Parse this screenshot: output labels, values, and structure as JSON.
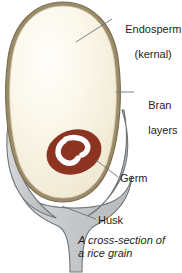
{
  "figure": {
    "background": "#ffffff"
  },
  "labels": {
    "endosperm": {
      "line1": "Endosperm",
      "line2": "(kernal)"
    },
    "bran": {
      "line1": "Bran",
      "line2": "layers"
    },
    "germ": "Germ",
    "husk": "Husk"
  },
  "caption": {
    "line1": "A cross-section of",
    "line2": "a rice grain"
  },
  "colors": {
    "endosperm_fill": "#f6f1e0",
    "endosperm_highlight": "#fdfcf7",
    "bran_band": "#9a8c6a",
    "bran_outline": "#7d6f4f",
    "germ_fill": "#8c3322",
    "germ_mark": "#ffffff",
    "husk_fill": "#c8cacc",
    "husk_outline": "#6f7478",
    "leader_line": "#6f7478",
    "text": "#231f20"
  },
  "parts": [
    {
      "name": "endosperm",
      "label": "Endosperm (kernal)"
    },
    {
      "name": "bran-layers",
      "label": "Bran layers"
    },
    {
      "name": "germ",
      "label": "Germ"
    },
    {
      "name": "husk",
      "label": "Husk"
    }
  ]
}
